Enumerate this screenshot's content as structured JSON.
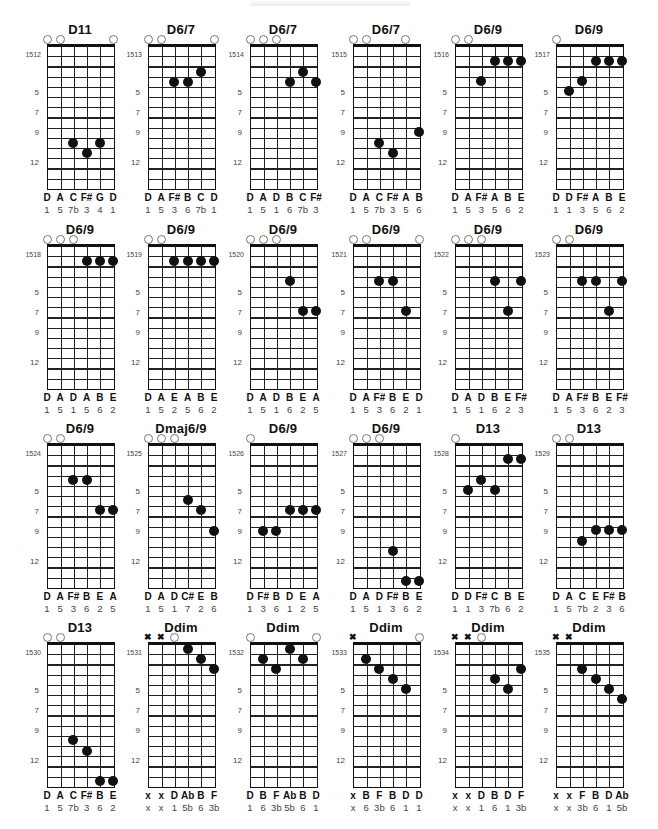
{
  "header": {
    "text": ""
  },
  "layout": {
    "col_x": [
      47,
      148,
      250,
      353,
      455,
      556
    ],
    "row_nut_y": [
      46,
      246,
      445,
      644
    ],
    "string_spacing": 13.2,
    "fret_spacing": 10.2,
    "fret_count": 14,
    "fret_labels": [
      {
        "label": "5",
        "y": 47
      },
      {
        "label": "7",
        "y": 67
      },
      {
        "label": "9",
        "y": 87
      },
      {
        "label": "12",
        "y": 117
      }
    ]
  },
  "chords": [
    {
      "id": "1512",
      "name": "D11",
      "row": 0,
      "col": 0,
      "open": [
        0,
        1,
        5
      ],
      "mute": [],
      "dots": [
        [
          2,
          97
        ],
        [
          3,
          107
        ],
        [
          4,
          97
        ]
      ],
      "notes": [
        "D",
        "A",
        "C",
        "F#",
        "G",
        "D"
      ],
      "intervals": [
        "1",
        "5",
        "7b",
        "3",
        "4",
        "1"
      ]
    },
    {
      "id": "1513",
      "name": "D6/7",
      "row": 0,
      "col": 1,
      "open": [
        0,
        1,
        5
      ],
      "mute": [],
      "dots": [
        [
          2,
          36
        ],
        [
          3,
          36
        ],
        [
          4,
          26
        ]
      ],
      "notes": [
        "D",
        "A",
        "F#",
        "B",
        "C",
        "D"
      ],
      "intervals": [
        "1",
        "5",
        "3",
        "6",
        "7b",
        "1"
      ]
    },
    {
      "id": "1514",
      "name": "D6/7",
      "row": 0,
      "col": 2,
      "open": [
        0,
        1,
        2
      ],
      "mute": [],
      "dots": [
        [
          3,
          36
        ],
        [
          4,
          26
        ],
        [
          5,
          36
        ]
      ],
      "notes": [
        "D",
        "A",
        "D",
        "B",
        "C",
        "F#"
      ],
      "intervals": [
        "1",
        "5",
        "1",
        "6",
        "7b",
        "3"
      ]
    },
    {
      "id": "1515",
      "name": "D6/7",
      "row": 0,
      "col": 3,
      "open": [
        0,
        1,
        4
      ],
      "mute": [],
      "dots": [
        [
          2,
          97
        ],
        [
          3,
          107
        ],
        [
          5,
          86
        ]
      ],
      "notes": [
        "D",
        "A",
        "C",
        "F#",
        "A",
        "B"
      ],
      "intervals": [
        "1",
        "5",
        "7b",
        "3",
        "5",
        "6"
      ]
    },
    {
      "id": "1516",
      "name": "D6/9",
      "row": 0,
      "col": 4,
      "open": [
        0,
        1
      ],
      "mute": [],
      "dots": [
        [
          2,
          35
        ],
        [
          3,
          15
        ],
        [
          4,
          15
        ],
        [
          5,
          15
        ]
      ],
      "notes": [
        "D",
        "A",
        "F#",
        "A",
        "B",
        "E"
      ],
      "intervals": [
        "1",
        "5",
        "3",
        "5",
        "6",
        "2"
      ]
    },
    {
      "id": "1517",
      "name": "D6/9",
      "row": 0,
      "col": 5,
      "open": [
        0
      ],
      "mute": [],
      "dots": [
        [
          1,
          45
        ],
        [
          2,
          35
        ],
        [
          3,
          15
        ],
        [
          4,
          15
        ],
        [
          5,
          15
        ]
      ],
      "notes": [
        "D",
        "D",
        "F#",
        "A",
        "B",
        "E"
      ],
      "intervals": [
        "1",
        "1",
        "3",
        "5",
        "6",
        "2"
      ]
    },
    {
      "id": "1518",
      "name": "D6/9",
      "row": 1,
      "col": 0,
      "open": [
        0,
        1,
        2
      ],
      "mute": [],
      "dots": [
        [
          3,
          15
        ],
        [
          4,
          15
        ],
        [
          5,
          15
        ]
      ],
      "notes": [
        "D",
        "A",
        "D",
        "A",
        "B",
        "E"
      ],
      "intervals": [
        "1",
        "5",
        "1",
        "5",
        "6",
        "2"
      ]
    },
    {
      "id": "1519",
      "name": "D6/9",
      "row": 1,
      "col": 1,
      "open": [
        0,
        1
      ],
      "mute": [],
      "dots": [
        [
          2,
          15
        ],
        [
          3,
          15
        ],
        [
          4,
          15
        ],
        [
          5,
          15
        ]
      ],
      "notes": [
        "D",
        "A",
        "E",
        "A",
        "B",
        "E"
      ],
      "intervals": [
        "1",
        "5",
        "2",
        "5",
        "6",
        "2"
      ]
    },
    {
      "id": "1520",
      "name": "D6/9",
      "row": 1,
      "col": 2,
      "open": [
        0,
        1,
        2
      ],
      "mute": [],
      "dots": [
        [
          3,
          35
        ],
        [
          4,
          65
        ],
        [
          5,
          65
        ]
      ],
      "notes": [
        "D",
        "A",
        "D",
        "B",
        "E",
        "A"
      ],
      "intervals": [
        "1",
        "5",
        "1",
        "6",
        "2",
        "5"
      ]
    },
    {
      "id": "1521",
      "name": "D6/9",
      "row": 1,
      "col": 3,
      "open": [
        0,
        1,
        5
      ],
      "mute": [],
      "dots": [
        [
          2,
          35
        ],
        [
          3,
          35
        ],
        [
          4,
          65
        ]
      ],
      "notes": [
        "D",
        "A",
        "F#",
        "B",
        "E",
        "D"
      ],
      "intervals": [
        "1",
        "5",
        "3",
        "6",
        "2",
        "1"
      ]
    },
    {
      "id": "1522",
      "name": "D6/9",
      "row": 1,
      "col": 4,
      "open": [
        0,
        1,
        2
      ],
      "mute": [],
      "dots": [
        [
          3,
          35
        ],
        [
          4,
          65
        ],
        [
          5,
          35
        ]
      ],
      "notes": [
        "D",
        "A",
        "D",
        "B",
        "E",
        "F#"
      ],
      "intervals": [
        "1",
        "5",
        "1",
        "6",
        "2",
        "3"
      ]
    },
    {
      "id": "1523",
      "name": "D6/9",
      "row": 1,
      "col": 5,
      "open": [
        0,
        1
      ],
      "mute": [],
      "dots": [
        [
          2,
          35
        ],
        [
          3,
          35
        ],
        [
          4,
          65
        ],
        [
          5,
          35
        ]
      ],
      "notes": [
        "D",
        "A",
        "F#",
        "B",
        "E",
        "F#"
      ],
      "intervals": [
        "1",
        "5",
        "3",
        "6",
        "2",
        "3"
      ]
    },
    {
      "id": "1524",
      "name": "D6/9",
      "row": 2,
      "col": 0,
      "open": [
        0,
        1
      ],
      "mute": [],
      "dots": [
        [
          2,
          35
        ],
        [
          3,
          35
        ],
        [
          4,
          65
        ],
        [
          5,
          65
        ]
      ],
      "notes": [
        "D",
        "A",
        "F#",
        "B",
        "E",
        "A"
      ],
      "intervals": [
        "1",
        "5",
        "3",
        "6",
        "2",
        "5"
      ]
    },
    {
      "id": "1525",
      "name": "Dmaj6/9",
      "row": 2,
      "col": 1,
      "open": [
        0,
        1,
        2
      ],
      "mute": [],
      "dots": [
        [
          3,
          55
        ],
        [
          4,
          65
        ],
        [
          5,
          86
        ]
      ],
      "notes": [
        "D",
        "A",
        "D",
        "C#",
        "E",
        "B"
      ],
      "intervals": [
        "1",
        "5",
        "1",
        "7",
        "2",
        "6"
      ]
    },
    {
      "id": "1526",
      "name": "D6/9",
      "row": 2,
      "col": 2,
      "open": [
        0
      ],
      "mute": [],
      "dots": [
        [
          1,
          86
        ],
        [
          2,
          86
        ],
        [
          3,
          65
        ],
        [
          4,
          65
        ],
        [
          5,
          65
        ]
      ],
      "notes": [
        "D",
        "F#",
        "B",
        "D",
        "E",
        "A"
      ],
      "intervals": [
        "1",
        "3",
        "6",
        "1",
        "2",
        "5"
      ]
    },
    {
      "id": "1527",
      "name": "D6/9",
      "row": 2,
      "col": 3,
      "open": [
        0,
        1,
        2
      ],
      "mute": [],
      "dots": [
        [
          3,
          106
        ],
        [
          4,
          136
        ],
        [
          5,
          136
        ]
      ],
      "notes": [
        "D",
        "A",
        "D",
        "F#",
        "B",
        "E"
      ],
      "intervals": [
        "1",
        "5",
        "1",
        "3",
        "6",
        "2"
      ]
    },
    {
      "id": "1528",
      "name": "D13",
      "row": 2,
      "col": 4,
      "open": [
        0
      ],
      "mute": [],
      "dots": [
        [
          1,
          45
        ],
        [
          2,
          35
        ],
        [
          3,
          45
        ],
        [
          4,
          14
        ],
        [
          5,
          14
        ]
      ],
      "notes": [
        "D",
        "D",
        "F#",
        "C",
        "B",
        "E"
      ],
      "intervals": [
        "1",
        "1",
        "3",
        "7b",
        "6",
        "2"
      ]
    },
    {
      "id": "1529",
      "name": "D13",
      "row": 2,
      "col": 5,
      "open": [
        0,
        1
      ],
      "mute": [],
      "dots": [
        [
          2,
          96
        ],
        [
          3,
          85
        ],
        [
          4,
          85
        ],
        [
          5,
          85
        ]
      ],
      "notes": [
        "D",
        "A",
        "C",
        "E",
        "F#",
        "B"
      ],
      "intervals": [
        "1",
        "5",
        "7b",
        "2",
        "3",
        "6"
      ]
    },
    {
      "id": "1530",
      "name": "D13",
      "row": 3,
      "col": 0,
      "open": [
        0,
        1
      ],
      "mute": [],
      "dots": [
        [
          2,
          96
        ],
        [
          3,
          107
        ],
        [
          4,
          137
        ],
        [
          5,
          137
        ]
      ],
      "notes": [
        "D",
        "A",
        "C",
        "F#",
        "B",
        "E"
      ],
      "intervals": [
        "1",
        "5",
        "7b",
        "3",
        "6",
        "2"
      ]
    },
    {
      "id": "1531",
      "name": "Ddim",
      "row": 3,
      "col": 1,
      "open": [
        2
      ],
      "mute": [
        0,
        1
      ],
      "dots": [
        [
          3,
          5
        ],
        [
          4,
          15
        ],
        [
          5,
          25
        ]
      ],
      "notes": [
        "x",
        "x",
        "D",
        "Ab",
        "B",
        "F"
      ],
      "intervals": [
        "x",
        "x",
        "1",
        "5b",
        "6",
        "3b"
      ]
    },
    {
      "id": "1532",
      "name": "Ddim",
      "row": 3,
      "col": 2,
      "open": [
        0,
        5
      ],
      "mute": [],
      "dots": [
        [
          1,
          15
        ],
        [
          2,
          25
        ],
        [
          3,
          5
        ],
        [
          4,
          15
        ]
      ],
      "notes": [
        "D",
        "B",
        "F",
        "Ab",
        "B",
        "D"
      ],
      "intervals": [
        "1",
        "6",
        "3b",
        "5b",
        "6",
        "1"
      ]
    },
    {
      "id": "1533",
      "name": "Ddim",
      "row": 3,
      "col": 3,
      "open": [
        5
      ],
      "mute": [
        0
      ],
      "dots": [
        [
          1,
          15
        ],
        [
          2,
          25
        ],
        [
          3,
          35
        ],
        [
          4,
          45
        ]
      ],
      "notes": [
        "x",
        "B",
        "F",
        "B",
        "D",
        "D"
      ],
      "intervals": [
        "x",
        "6",
        "3b",
        "6",
        "1",
        "1"
      ]
    },
    {
      "id": "1534",
      "name": "Ddim",
      "row": 3,
      "col": 4,
      "open": [
        2
      ],
      "mute": [
        0,
        1
      ],
      "dots": [
        [
          3,
          35
        ],
        [
          4,
          45
        ],
        [
          5,
          25
        ]
      ],
      "notes": [
        "x",
        "x",
        "D",
        "B",
        "D",
        "F"
      ],
      "intervals": [
        "x",
        "x",
        "1",
        "6",
        "1",
        "3b"
      ]
    },
    {
      "id": "1535",
      "name": "Ddim",
      "row": 3,
      "col": 5,
      "open": [],
      "mute": [
        0,
        1
      ],
      "dots": [
        [
          2,
          25
        ],
        [
          3,
          35
        ],
        [
          4,
          45
        ],
        [
          5,
          55
        ]
      ],
      "notes": [
        "x",
        "x",
        "F",
        "B",
        "D",
        "Ab"
      ],
      "intervals": [
        "x",
        "x",
        "3b",
        "6",
        "1",
        "5b"
      ]
    }
  ]
}
